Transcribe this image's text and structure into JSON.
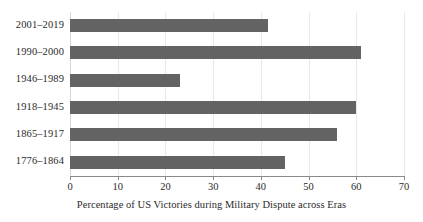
{
  "chart_data": {
    "type": "bar",
    "orientation": "horizontal",
    "title": "",
    "subtitle": "",
    "xlabel": "Percentage of US Victories during Military Dispute across Eras",
    "ylabel": "",
    "categories": [
      "1776–1864",
      "1865–1917",
      "1918–1945",
      "1946–1989",
      "1990–2000",
      "2001–2019"
    ],
    "values": [
      45,
      56,
      60,
      23,
      61,
      41.5
    ],
    "xlim": [
      0,
      70
    ],
    "ylim": null,
    "xticks": [
      0,
      10,
      20,
      30,
      40,
      50,
      60,
      70
    ],
    "xtick_labels": [
      "0",
      "10",
      "20",
      "30",
      "40",
      "50",
      "60",
      "70"
    ],
    "grid": "vertical",
    "legend": null,
    "bar_color": "#636363",
    "gridline_color": "#e9e9e9",
    "axis_color": "#8a8a8a",
    "series": [
      {
        "name": "Percentage of US Victories",
        "values": [
          45,
          56,
          60,
          23,
          61,
          41.5
        ]
      }
    ]
  }
}
